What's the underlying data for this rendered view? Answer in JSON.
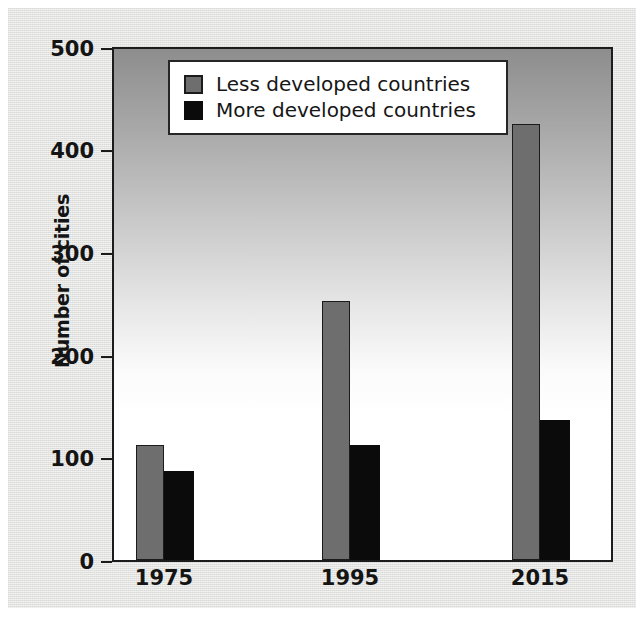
{
  "chart_data": {
    "type": "bar",
    "title": "",
    "subtitle": "",
    "xlabel": "",
    "ylabel": "Number of cities",
    "categories": [
      "1975",
      "1995",
      "2015"
    ],
    "series": [
      {
        "name": "Less developed countries",
        "color": "#6e6e6e",
        "values": [
          113,
          253,
          427
        ]
      },
      {
        "name": "More developed countries",
        "color": "#0b0b0b",
        "values": [
          87,
          113,
          137
        ]
      }
    ],
    "ylim": [
      0,
      500
    ],
    "ytick_values": [
      0,
      100,
      200,
      300,
      400,
      500
    ],
    "ytick_labels": [
      "0",
      "100",
      "200",
      "300",
      "400",
      "500"
    ],
    "grid": false,
    "legend_position": "top-left-inside",
    "legend_entries": [
      "Less developed countries",
      "More developed countries"
    ]
  },
  "legend": {
    "items": [
      {
        "label": "Less developed countries",
        "swatch": "legend-swatch-gray"
      },
      {
        "label": "More developed countries",
        "swatch": "legend-swatch-black"
      }
    ]
  },
  "axes": {
    "y_title": "Number of cities",
    "y_ticks": [
      "500",
      "400",
      "300",
      "200",
      "100",
      "0"
    ],
    "x_ticks": [
      "1975",
      "1995",
      "2015"
    ]
  }
}
